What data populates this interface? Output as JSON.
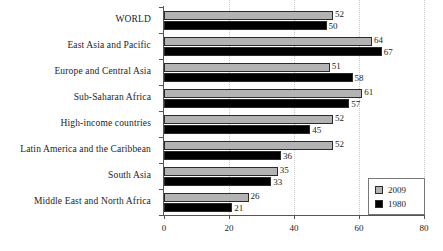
{
  "chart_data": {
    "type": "bar",
    "orientation": "horizontal",
    "title": "",
    "xlabel": "",
    "ylabel": "",
    "xlim": [
      0,
      80
    ],
    "xticks": [
      0,
      20,
      40,
      60,
      80
    ],
    "xtick_labels": [
      "0",
      "20",
      "40",
      "60",
      "80"
    ],
    "grid": true,
    "legend_position": "bottom-right",
    "categories": [
      "WORLD",
      "East Asia and Pacific",
      "Europe and Central Asia",
      "Sub-Saharan Africa",
      "High-income countries",
      "Latin America and the Caribbean",
      "South Asia",
      "Middle East and North Africa"
    ],
    "series": [
      {
        "name": "2009",
        "color": "#b3b3b3",
        "values": [
          52,
          64,
          51,
          61,
          52,
          52,
          35,
          26
        ],
        "labels": [
          "52",
          "64",
          "51",
          "61",
          "52",
          "52",
          "35",
          "26"
        ]
      },
      {
        "name": "1980",
        "color": "#000000",
        "values": [
          50,
          67,
          58,
          57,
          45,
          36,
          33,
          21
        ],
        "labels": [
          "50",
          "67",
          "58",
          "57",
          "45",
          "36",
          "33",
          "21"
        ]
      }
    ]
  }
}
